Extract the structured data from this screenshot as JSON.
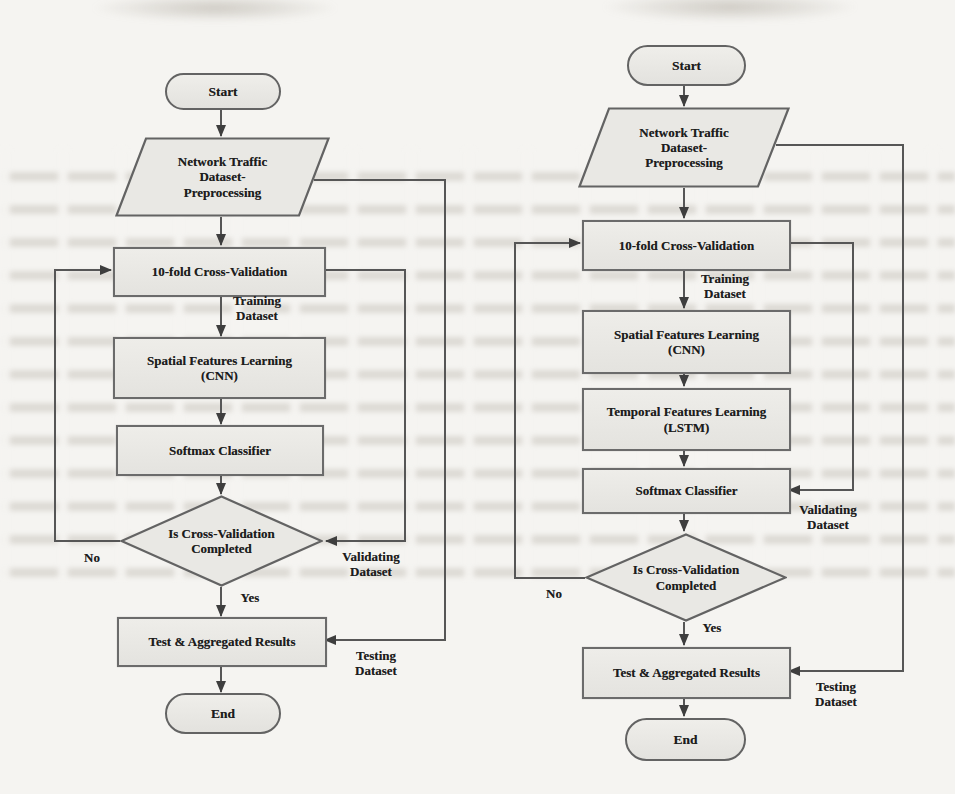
{
  "figure": {
    "type": "flowchart-pair",
    "colors": {
      "page_background": "#f5f4f1",
      "node_fill": "#e9e8e4",
      "node_border": "#6b6b6b",
      "connector": "#565656",
      "text": "#1d1d1d"
    },
    "left": {
      "nodes": {
        "start": "Start",
        "preprocessing": "Network Traffic\nDataset-\nPreprocessing",
        "cross_validation": "10-fold Cross-Validation",
        "spatial_learning": "Spatial Features Learning\n(CNN)",
        "softmax": "Softmax Classifier",
        "decision": "Is Cross-Validation\nCompleted",
        "results": "Test & Aggregated Results",
        "end": "End"
      },
      "labels": {
        "training": "Training\nDataset",
        "validating": "Validating\nDataset",
        "testing": "Testing\nDataset",
        "no": "No",
        "yes": "Yes"
      }
    },
    "right": {
      "nodes": {
        "start": "Start",
        "preprocessing": "Network Traffic\nDataset-\nPreprocessing",
        "cross_validation": "10-fold Cross-Validation",
        "spatial_learning": "Spatial Features Learning\n(CNN)",
        "temporal_learning": "Temporal Features Learning\n(LSTM)",
        "softmax": "Softmax Classifier",
        "decision": "Is Cross-Validation\nCompleted",
        "results": "Test & Aggregated Results",
        "end": "End"
      },
      "labels": {
        "training": "Training\nDataset",
        "validating": "Validating\nDataset",
        "testing": "Testing\nDataset",
        "no": "No",
        "yes": "Yes"
      }
    }
  }
}
